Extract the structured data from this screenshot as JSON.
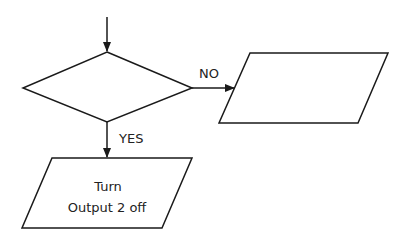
{
  "diagram": {
    "type": "flowchart",
    "colors": {
      "stroke": "#1a1a1a",
      "background": "#ffffff",
      "text": "#222222"
    },
    "nodes": [
      {
        "id": "decision",
        "shape": "diamond",
        "text": ""
      },
      {
        "id": "no-output",
        "shape": "parallelogram",
        "text": ""
      },
      {
        "id": "yes-output",
        "shape": "parallelogram",
        "lines": [
          "Turn",
          "Output 2 off"
        ]
      }
    ],
    "edges": [
      {
        "from": "entry",
        "to": "decision",
        "label": ""
      },
      {
        "from": "decision",
        "to": "no-output",
        "label": "NO"
      },
      {
        "from": "decision",
        "to": "yes-output",
        "label": "YES"
      }
    ]
  }
}
